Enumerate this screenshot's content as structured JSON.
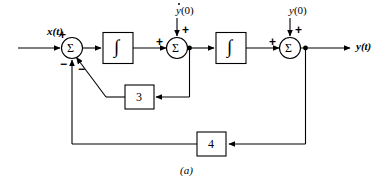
{
  "figure": {
    "caption": "(a)"
  },
  "signals": {
    "input_label": "x(t)",
    "output_label": "y(t)",
    "initial_condition_derivative": "y(0)",
    "initial_condition_derivative_base": "y",
    "initial_condition_derivative_arg": "(0)",
    "initial_condition_position": "y(0)",
    "initial_condition_position_base": "y",
    "initial_condition_position_arg": "(0)"
  },
  "summers": [
    {
      "name": "summer-1",
      "symbol": "Σ",
      "signs": [
        {
          "label": "+",
          "position": "input-left"
        },
        {
          "label": "−",
          "position": "feedback-outer"
        },
        {
          "label": "−",
          "position": "feedback-inner"
        }
      ]
    },
    {
      "name": "summer-2",
      "symbol": "Σ",
      "signs": [
        {
          "label": "+",
          "position": "input-left"
        },
        {
          "label": "+",
          "position": "input-top"
        }
      ]
    },
    {
      "name": "summer-3",
      "symbol": "Σ",
      "signs": [
        {
          "label": "+",
          "position": "input-left"
        },
        {
          "label": "+",
          "position": "input-top"
        }
      ]
    }
  ],
  "integrators": [
    {
      "name": "integrator-1",
      "symbol": "∫"
    },
    {
      "name": "integrator-2",
      "symbol": "∫"
    }
  ],
  "gains": [
    {
      "name": "gain-inner",
      "value": "3"
    },
    {
      "name": "gain-outer",
      "value": "4"
    }
  ],
  "colors": {
    "line": "#000000",
    "background": "#ffffff",
    "text": "#000000"
  }
}
